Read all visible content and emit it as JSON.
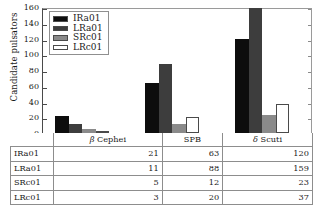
{
  "chart_data": {
    "type": "bar",
    "title": "",
    "xlabel": "",
    "ylabel": "Candidate pulsators",
    "ylim": [
      0,
      160
    ],
    "yticks": [
      0,
      20,
      40,
      60,
      80,
      100,
      120,
      140,
      160
    ],
    "grid": false,
    "legend_position": "upper-left",
    "categories": [
      "β Cephei",
      "SPB",
      "δ Scuti"
    ],
    "series": [
      {
        "name": "IRa01",
        "values": [
          21,
          63,
          120
        ],
        "color": "#0d0d0d"
      },
      {
        "name": "LRa01",
        "values": [
          11,
          88,
          159
        ],
        "color": "#3d3d3d"
      },
      {
        "name": "SRc01",
        "values": [
          5,
          12,
          23
        ],
        "color": "#8a8a8a"
      },
      {
        "name": "LRc01",
        "values": [
          3,
          20,
          37
        ],
        "color": "#ffffff"
      }
    ]
  },
  "axis": {
    "ylabel": "Candidate pulsators",
    "ytick_labels": [
      "0",
      "20",
      "40",
      "60",
      "80",
      "100",
      "120",
      "140",
      "160"
    ]
  },
  "legend": {
    "items": [
      {
        "label": "IRa01"
      },
      {
        "label": "LRa01"
      },
      {
        "label": "SRc01"
      },
      {
        "label": "LRc01"
      }
    ]
  },
  "table": {
    "header": [
      "",
      "β Cephei",
      "SPB",
      "δ Scuti"
    ],
    "header_greek": [
      false,
      true,
      false,
      true
    ],
    "rows": [
      {
        "name": "IRa01",
        "values": [
          "21",
          "63",
          "120"
        ]
      },
      {
        "name": "LRa01",
        "values": [
          "11",
          "88",
          "159"
        ]
      },
      {
        "name": "SRc01",
        "values": [
          "5",
          "12",
          "23"
        ]
      },
      {
        "name": "LRc01",
        "values": [
          "3",
          "20",
          "37"
        ]
      }
    ]
  }
}
